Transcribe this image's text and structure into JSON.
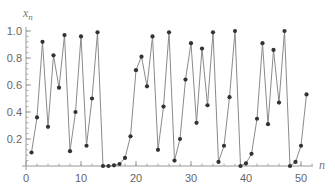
{
  "chart_data": {
    "type": "line",
    "title": "",
    "xlabel": "n",
    "ylabel": "x_n",
    "ylabel_main": "x",
    "ylabel_sub": "n",
    "xlim": [
      0,
      52
    ],
    "ylim": [
      0,
      1.02
    ],
    "grid": false,
    "legend": null,
    "x_ticks": [
      0,
      10,
      20,
      30,
      40,
      50
    ],
    "x_tick_labels": [
      "0",
      "10",
      "20",
      "30",
      "40",
      "50"
    ],
    "y_ticks": [
      0.2,
      0.4,
      0.6,
      0.8,
      1.0
    ],
    "y_tick_labels": [
      "0.2",
      "0.4",
      "0.6",
      "0.8",
      "1.0"
    ],
    "markers": true,
    "series": [
      {
        "name": "x_n",
        "x": [
          1,
          2,
          3,
          4,
          5,
          6,
          7,
          8,
          9,
          10,
          11,
          12,
          13,
          14,
          15,
          16,
          17,
          18,
          19,
          20,
          21,
          22,
          23,
          24,
          25,
          26,
          27,
          28,
          29,
          30,
          31,
          32,
          33,
          34,
          35,
          36,
          37,
          38,
          39,
          40,
          41,
          42,
          43,
          44,
          45,
          46,
          47,
          48,
          49,
          50,
          51
        ],
        "values": [
          0.1,
          0.36,
          0.92,
          0.29,
          0.82,
          0.58,
          0.97,
          0.11,
          0.4,
          0.96,
          0.15,
          0.5,
          0.99,
          0.0,
          0.0,
          0.005,
          0.015,
          0.06,
          0.22,
          0.71,
          0.81,
          0.59,
          0.96,
          0.12,
          0.44,
          0.99,
          0.04,
          0.2,
          0.64,
          0.91,
          0.32,
          0.87,
          0.45,
          0.99,
          0.03,
          0.15,
          0.51,
          1.0,
          0.0,
          0.02,
          0.09,
          0.35,
          0.91,
          0.31,
          0.86,
          0.47,
          1.0,
          0.0,
          0.03,
          0.15,
          0.53
        ]
      }
    ],
    "colors": {
      "line": "#8a8a8a",
      "marker": "#333333",
      "axis": "#999999",
      "tick_label": "#666666"
    }
  }
}
